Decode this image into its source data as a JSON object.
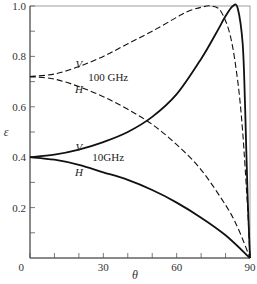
{
  "chart_data": {
    "type": "line",
    "title": "",
    "xlabel": "θ",
    "ylabel": "ε",
    "xlim": [
      0,
      90
    ],
    "ylim": [
      0,
      1.0
    ],
    "grid": false,
    "legend": "none (inline annotations)",
    "xticks": [
      0,
      30,
      60,
      90
    ],
    "xtick_labels": [
      "0",
      "30",
      "60",
      "90"
    ],
    "x_minor_ticks": [
      10,
      20,
      40,
      50,
      70,
      80
    ],
    "yticks": [
      0.2,
      0.4,
      0.6,
      0.8,
      1.0
    ],
    "ytick_labels": [
      "0.2",
      "0.4",
      "0.6",
      "0.8",
      "1.0"
    ],
    "y_minor_ticks": [
      0.1,
      0.3,
      0.5,
      0.7,
      0.9
    ],
    "origin_label": "0",
    "annotations": [
      {
        "text": "V",
        "near": "100 GHz V curve",
        "x": 20,
        "y": 0.77
      },
      {
        "text": "100 GHz",
        "x": 32,
        "y": 0.72
      },
      {
        "text": "H",
        "near": "100 GHz H curve",
        "x": 20,
        "y": 0.67
      },
      {
        "text": "V",
        "near": "10 GHz V curve",
        "x": 20,
        "y": 0.44
      },
      {
        "text": "10GHz",
        "x": 32,
        "y": 0.4
      },
      {
        "text": "H",
        "near": "10 GHz H curve",
        "x": 20,
        "y": 0.34
      }
    ],
    "series": [
      {
        "name": "100 GHz V",
        "style": "dashed",
        "x": [
          0,
          10,
          20,
          30,
          40,
          50,
          60,
          65,
          70,
          74,
          78,
          82,
          85,
          87,
          89,
          90
        ],
        "y": [
          0.72,
          0.73,
          0.76,
          0.8,
          0.85,
          0.9,
          0.955,
          0.98,
          0.995,
          1.0,
          0.98,
          0.88,
          0.7,
          0.5,
          0.2,
          0.0
        ]
      },
      {
        "name": "100 GHz H",
        "style": "dashed",
        "x": [
          0,
          10,
          20,
          30,
          40,
          50,
          60,
          70,
          80,
          85,
          90
        ],
        "y": [
          0.72,
          0.71,
          0.68,
          0.64,
          0.59,
          0.53,
          0.45,
          0.35,
          0.21,
          0.12,
          0.0
        ]
      },
      {
        "name": "10 GHz V",
        "style": "solid",
        "x": [
          0,
          10,
          20,
          30,
          40,
          50,
          60,
          70,
          76,
          80,
          83,
          85,
          87,
          88,
          89,
          90
        ],
        "y": [
          0.4,
          0.41,
          0.43,
          0.46,
          0.5,
          0.56,
          0.65,
          0.79,
          0.89,
          0.96,
          1.0,
          0.99,
          0.85,
          0.6,
          0.25,
          0.0
        ]
      },
      {
        "name": "10 GHz H",
        "style": "solid",
        "x": [
          0,
          10,
          20,
          30,
          40,
          50,
          60,
          70,
          80,
          90
        ],
        "y": [
          0.4,
          0.39,
          0.37,
          0.34,
          0.31,
          0.27,
          0.22,
          0.16,
          0.09,
          0.0
        ]
      }
    ]
  }
}
